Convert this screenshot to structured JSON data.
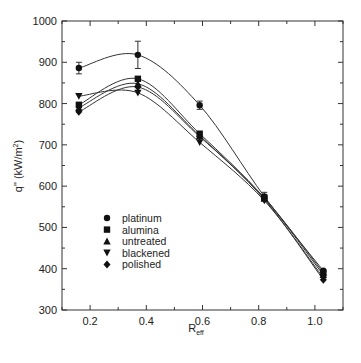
{
  "chart_data": {
    "type": "line",
    "title": "",
    "xlabel": "R",
    "xlabel_subscript": "eff",
    "ylabel": "q\" (kW/m",
    "ylabel_superscript": "2",
    "ylabel_suffix": ")",
    "xlim": [
      0.1,
      1.1
    ],
    "ylim": [
      300,
      1000
    ],
    "xticks": [
      0.2,
      0.4,
      0.6,
      0.8,
      1.0
    ],
    "xtick_labels": [
      "0.2",
      "0.4",
      "0.6",
      "0.8",
      "1.0"
    ],
    "xminor": [
      0.1,
      0.3,
      0.5,
      0.7,
      0.9,
      1.1
    ],
    "yticks": [
      300,
      400,
      500,
      600,
      700,
      800,
      900,
      1000
    ],
    "ytick_labels": [
      "300",
      "400",
      "500",
      "600",
      "700",
      "800",
      "900",
      "1000"
    ],
    "yminor": [
      350,
      450,
      550,
      650,
      750,
      850,
      950
    ],
    "grid": false,
    "legend_position": "lower-left",
    "x": [
      0.16,
      0.37,
      0.59,
      0.82,
      1.03
    ],
    "series": [
      {
        "name": "platinum",
        "marker": "circle",
        "values": [
          886,
          918,
          796,
          575,
          395
        ],
        "errors": [
          14,
          33,
          10,
          10,
          0
        ]
      },
      {
        "name": "alumina",
        "marker": "square",
        "values": [
          797,
          860,
          727,
          572,
          390
        ],
        "errors": [
          0,
          0,
          0,
          0,
          0
        ]
      },
      {
        "name": "untreated",
        "marker": "triangle-up",
        "values": [
          790,
          848,
          722,
          570,
          385
        ],
        "errors": [
          0,
          0,
          0,
          0,
          0
        ]
      },
      {
        "name": "blackened",
        "marker": "triangle-down",
        "values": [
          818,
          826,
          706,
          565,
          378
        ],
        "errors": [
          0,
          0,
          0,
          0,
          0
        ]
      },
      {
        "name": "polished",
        "marker": "diamond",
        "values": [
          780,
          840,
          720,
          568,
          373
        ],
        "errors": [
          0,
          0,
          0,
          0,
          0
        ]
      }
    ]
  }
}
